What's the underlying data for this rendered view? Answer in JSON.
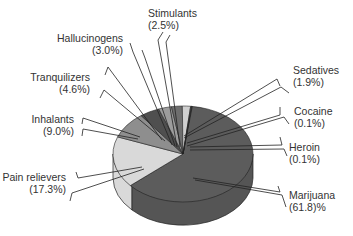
{
  "chart_data": {
    "type": "pie",
    "style": "3d",
    "title": "",
    "unit": "%",
    "slices": [
      {
        "label": "Marijuana",
        "value": 61.8,
        "value_text": "(61.8)%",
        "color": "#5c5c5c"
      },
      {
        "label": "Pain relievers",
        "value": 17.3,
        "value_text": "(17.3%)",
        "color": "#d9d9d9"
      },
      {
        "label": "Inhalants",
        "value": 9.0,
        "value_text": "(9.0%)",
        "color": "#8e8e8e"
      },
      {
        "label": "Tranquilizers",
        "value": 4.6,
        "value_text": "(4.6%)",
        "color": "#4f4f4f"
      },
      {
        "label": "Hallucinogens",
        "value": 3.0,
        "value_text": "(3.0%)",
        "color": "#9c9c9c"
      },
      {
        "label": "Stimulants",
        "value": 2.5,
        "value_text": "(2.5%)",
        "color": "#6e6e6e"
      },
      {
        "label": "Sedatives",
        "value": 1.9,
        "value_text": "(1.9%)",
        "color": "#cfcfcf"
      },
      {
        "label": "Cocaine",
        "value": 0.1,
        "value_text": "(0.1%)",
        "color": "#7a7a7a"
      },
      {
        "label": "Heroin",
        "value": 0.1,
        "value_text": "(0.1%)",
        "color": "#444444"
      }
    ],
    "legend": "callout labels"
  },
  "labels": {
    "stimulants": {
      "name": "Stimulants",
      "pct": "(2.5%)"
    },
    "hallucinogens": {
      "name": "Hallucinogens",
      "pct": "(3.0%)"
    },
    "tranquilizers": {
      "name": "Tranquilizers",
      "pct": "(4.6%)"
    },
    "inhalants": {
      "name": "Inhalants",
      "pct": "(9.0%)"
    },
    "pain_relievers": {
      "name": "Pain relievers",
      "pct": "(17.3%)"
    },
    "sedatives": {
      "name": "Sedatives",
      "pct": "(1.9%)"
    },
    "cocaine": {
      "name": "Cocaine",
      "pct": "(0.1%)"
    },
    "heroin": {
      "name": "Heroin",
      "pct": "(0.1%)"
    },
    "marijuana": {
      "name": "Marijuana",
      "pct": "(61.8)%"
    }
  }
}
